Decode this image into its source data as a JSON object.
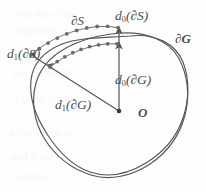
{
  "figure": {
    "kind": "scanned-mathematical-diagram",
    "ink_color": "#4b4b4b",
    "background_color": "#fefefe",
    "dot_color": "#6a6a6a",
    "labels": {
      "d0_dS": {
        "base": "d",
        "sub": "0",
        "arg": "(∂S)"
      },
      "d1_dS": {
        "base": "d",
        "sub": "1",
        "arg": "(∂S)"
      },
      "d0_dG": {
        "base": "d",
        "sub": "0",
        "arg": "(∂G)"
      },
      "d1_dG": {
        "base": "d",
        "sub": "1",
        "arg": "(∂G)"
      },
      "boundary_S": "∂S",
      "boundary_G": "∂G",
      "origin": "O"
    },
    "ghost_lines": [
      "the the of the",
      "completely surrounded",
      "and the set of",
      "a point in this",
      "a curve that is",
      "and it has",
      "simple"
    ]
  }
}
